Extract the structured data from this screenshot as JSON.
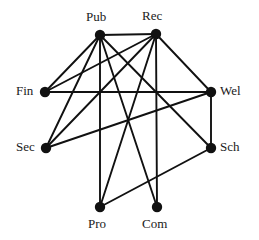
{
  "figure": {
    "type": "graph-diagram",
    "title": "",
    "background_color": "#ffffff",
    "edge_color": "#111111",
    "node_color": "#111111",
    "label_color": "#1a1a1a",
    "node_radius": 5.2,
    "edge_width": 1.9,
    "width": 259,
    "height": 240
  },
  "nodes": [
    {
      "id": "Pub",
      "label": "Pub",
      "x": 100,
      "y": 35,
      "label_x": 86,
      "label_y": 10
    },
    {
      "id": "Rec",
      "label": "Rec",
      "x": 156,
      "y": 34,
      "label_x": 142,
      "label_y": 9
    },
    {
      "id": "Fin",
      "label": "Fin",
      "x": 45,
      "y": 92,
      "label_x": 16,
      "label_y": 84
    },
    {
      "id": "Wel",
      "label": "Wel",
      "x": 211,
      "y": 92,
      "label_x": 220,
      "label_y": 84
    },
    {
      "id": "Sec",
      "label": "Sec",
      "x": 46,
      "y": 148,
      "label_x": 16,
      "label_y": 140
    },
    {
      "id": "Sch",
      "label": "Sch",
      "x": 211,
      "y": 148,
      "label_x": 220,
      "label_y": 140
    },
    {
      "id": "Pro",
      "label": "Pro",
      "x": 100,
      "y": 207,
      "label_x": 88,
      "label_y": 217
    },
    {
      "id": "Com",
      "label": "Com",
      "x": 157,
      "y": 207,
      "label_x": 142,
      "label_y": 217
    }
  ],
  "edges": [
    {
      "source": "Pub",
      "target": "Rec"
    },
    {
      "source": "Pub",
      "target": "Fin"
    },
    {
      "source": "Pub",
      "target": "Sec"
    },
    {
      "source": "Pub",
      "target": "Pro"
    },
    {
      "source": "Pub",
      "target": "Sch"
    },
    {
      "source": "Pub",
      "target": "Com"
    },
    {
      "source": "Rec",
      "target": "Fin"
    },
    {
      "source": "Rec",
      "target": "Sec"
    },
    {
      "source": "Rec",
      "target": "Wel"
    },
    {
      "source": "Rec",
      "target": "Pro"
    },
    {
      "source": "Rec",
      "target": "Com"
    },
    {
      "source": "Fin",
      "target": "Wel"
    },
    {
      "source": "Sec",
      "target": "Wel"
    },
    {
      "source": "Wel",
      "target": "Sch"
    },
    {
      "source": "Sch",
      "target": "Pro"
    }
  ]
}
